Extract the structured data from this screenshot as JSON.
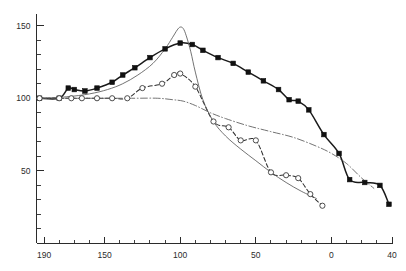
{
  "chart_data": {
    "type": "line",
    "title": "",
    "subtitle": "",
    "xlabel": "",
    "ylabel": "",
    "xlim": [
      195,
      -40
    ],
    "ylim": [
      0,
      158
    ],
    "x_axis_reversed": true,
    "grid": false,
    "legend_position": "none",
    "x_ticks_major": [
      190,
      150,
      100,
      50,
      0,
      -40
    ],
    "x_tick_labels": [
      "190",
      "150",
      "100",
      "50",
      "0",
      "40"
    ],
    "x_tick_minor_step": 10,
    "y_ticks_major": [
      50,
      100,
      150
    ],
    "y_tick_labels": [
      "50",
      "100",
      "150"
    ],
    "y_tick_minor_step": 10,
    "series": [
      {
        "name": "filled-squares-curve",
        "marker": "filled-square",
        "line_style": "solid-thick",
        "x": [
          193,
          180,
          174,
          170,
          163,
          155,
          145,
          138,
          130,
          120,
          110,
          100,
          92,
          85,
          75,
          65,
          55,
          45,
          35,
          28,
          22,
          15,
          5,
          -5,
          -12,
          -22,
          -32,
          -38
        ],
        "y": [
          100,
          100,
          107,
          106,
          105,
          107,
          111,
          116,
          121,
          128,
          134,
          138,
          137,
          133,
          128,
          124,
          118,
          112,
          106,
          99,
          98,
          92,
          75,
          62,
          44,
          42,
          40,
          27
        ]
      },
      {
        "name": "open-circles-dashed-curve",
        "marker": "open-circle",
        "line_style": "dashed",
        "x": [
          193,
          180,
          172,
          165,
          155,
          145,
          135,
          125,
          112,
          104,
          100,
          90,
          78,
          68,
          60,
          50,
          40,
          30,
          22,
          14,
          6
        ],
        "y": [
          100,
          100,
          100,
          100,
          100,
          100,
          100,
          107,
          110,
          116,
          117,
          108,
          84,
          80,
          71,
          71,
          49,
          47,
          45,
          34,
          26
        ]
      },
      {
        "name": "sharp-peak-thin-curve",
        "marker": "none",
        "line_style": "solid-thin",
        "x": [
          193,
          175,
          160,
          148,
          138,
          128,
          118,
          110,
          105,
          102,
          100,
          98,
          96,
          93,
          90,
          85,
          78,
          70,
          60,
          50,
          40,
          30,
          20,
          10
        ],
        "y": [
          100,
          101,
          103,
          106,
          110,
          116,
          124,
          134,
          142,
          147,
          149,
          148,
          143,
          132,
          118,
          99,
          84,
          74,
          65,
          57,
          49,
          42,
          36,
          31
        ]
      },
      {
        "name": "flat-dashdot-baseline-curve",
        "marker": "none",
        "line_style": "dash-dot",
        "x": [
          193,
          170,
          150,
          130,
          115,
          105,
          98,
          90,
          80,
          70,
          55,
          40,
          25,
          10,
          0,
          -10,
          -20,
          -28
        ],
        "y": [
          100,
          100,
          100,
          100,
          100,
          99,
          98,
          95,
          90,
          86,
          81,
          77,
          73,
          67,
          62,
          55,
          45,
          38
        ]
      }
    ]
  },
  "axes": {
    "x_axis_name": "x-axis",
    "y_axis_name": "y-axis"
  }
}
